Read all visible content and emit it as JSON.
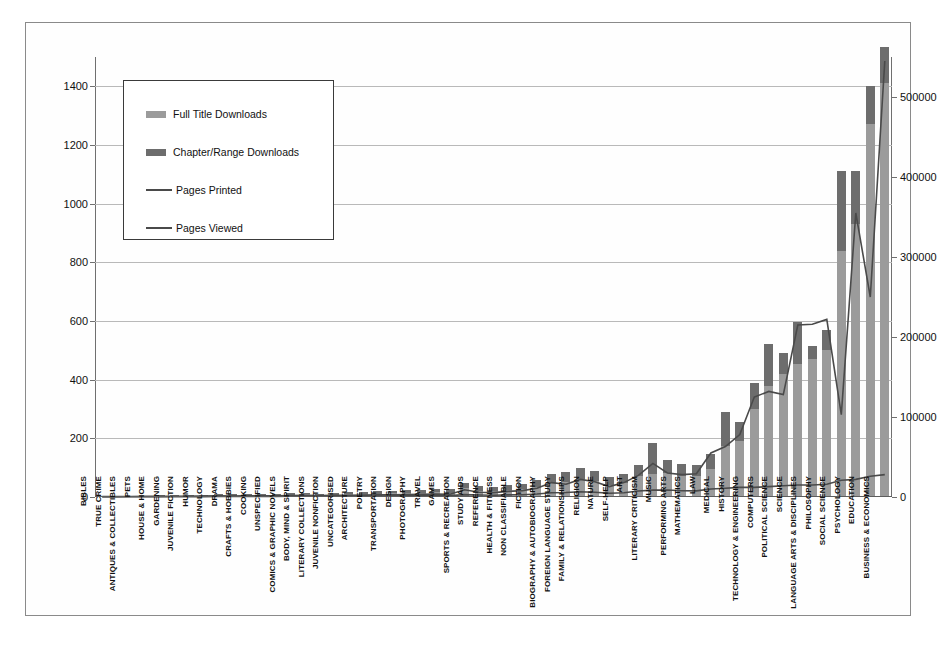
{
  "chart_data": {
    "type": "bar",
    "title": "",
    "subtitle": "",
    "xlabel": "",
    "ylabel": "",
    "y2label": "",
    "grid": true,
    "legend_position": "upper-left-inside",
    "ylim": [
      0,
      1500
    ],
    "y2lim": [
      0,
      550000
    ],
    "yticks": [
      "0",
      "200",
      "400",
      "600",
      "800",
      "1000",
      "1200",
      "1400"
    ],
    "ytick_values": [
      0,
      200,
      400,
      600,
      800,
      1000,
      1200,
      1400
    ],
    "y2ticks": [
      "0",
      "100000",
      "200000",
      "300000",
      "400000",
      "500000"
    ],
    "y2tick_values": [
      0,
      100000,
      200000,
      300000,
      400000,
      500000
    ],
    "categories": [
      "BIBLES",
      "TRUE CRIME",
      "ANTIQUES & COLLECTIBLES",
      "PETS",
      "HOUSE & HOME",
      "GARDENING",
      "JUVENILE FICTION",
      "HUMOR",
      "TECHNOLOGY",
      "DRAMA",
      "CRAFTS & HOBBIES",
      "COOKING",
      "UNSPECIFIED",
      "COMICS & GRAPHIC NOVELS",
      "BODY, MIND & SPIRIT",
      "LITERARY COLLECTIONS",
      "JUVENILE NONFICTION",
      "UNCATEGORISED",
      "ARCHITECTURE",
      "POETRY",
      "TRANSPORTATION",
      "DESIGN",
      "PHOTOGRAPHY",
      "TRAVEL",
      "GAMES",
      "SPORTS & RECREATION",
      "STUDY AIDS",
      "REFERENCE",
      "HEALTH & FITNESS",
      "NON CLASSIFIABLE",
      "FICTION",
      "BIOGRAPHY & AUTOBIOGRAPHY",
      "FOREIGN LANGUAGE STUDY",
      "FAMILY & RELATIONSHIPS",
      "RELIGION",
      "NATURE",
      "SELF-HELP",
      "ART",
      "LITERARY CRITICISM",
      "MUSIC",
      "PERFORMING ARTS",
      "MATHEMATICS",
      "LAW",
      "MEDICAL",
      "HISTORY",
      "TECHNOLOGY & ENGINEERING",
      "COMPUTERS",
      "POLITICAL SCIENCE",
      "SCIENCE",
      "LANGUAGE ARTS & DISCIPLINES",
      "PHILOSOPHY",
      "SOCIAL SCIENCE",
      "PSYCHOLOGY",
      "EDUCATION",
      "BUSINESS & ECONOMICS"
    ],
    "series": [
      {
        "name": "Full Title Downloads",
        "axis": "left",
        "kind": "bar-stacked",
        "color": "#9b9b9b",
        "values": [
          1,
          1,
          2,
          2,
          3,
          3,
          4,
          4,
          6,
          5,
          6,
          7,
          6,
          8,
          9,
          7,
          8,
          9,
          10,
          11,
          12,
          13,
          14,
          16,
          15,
          30,
          22,
          20,
          24,
          26,
          35,
          48,
          52,
          60,
          55,
          42,
          48,
          70,
          80,
          82,
          72,
          70,
          95,
          175,
          190,
          300,
          380,
          420,
          455,
          470,
          500,
          840,
          930,
          1270,
          1410
        ]
      },
      {
        "name": "Chapter/Range Downloads",
        "axis": "left",
        "kind": "bar-stacked",
        "color": "#6d6d6d",
        "values": [
          1,
          1,
          2,
          2,
          2,
          2,
          3,
          3,
          5,
          4,
          5,
          5,
          5,
          6,
          6,
          5,
          6,
          7,
          8,
          8,
          9,
          10,
          11,
          12,
          12,
          18,
          14,
          15,
          16,
          18,
          24,
          30,
          32,
          38,
          34,
          26,
          30,
          40,
          105,
          45,
          40,
          40,
          50,
          115,
          65,
          90,
          140,
          70,
          140,
          45,
          70,
          270,
          180,
          130,
          125
        ]
      },
      {
        "name": "Pages Printed",
        "axis": "right",
        "kind": "line",
        "color": "#4a4a4a",
        "values": [
          200,
          200,
          300,
          300,
          400,
          400,
          500,
          500,
          700,
          600,
          700,
          800,
          700,
          900,
          1000,
          900,
          1000,
          1100,
          1200,
          1300,
          1400,
          1500,
          1600,
          1800,
          1700,
          3000,
          2500,
          2300,
          2600,
          2900,
          3800,
          5200,
          5600,
          6500,
          6000,
          4600,
          5200,
          7500,
          8600,
          8800,
          7800,
          7600,
          10000,
          11000,
          12000,
          12000,
          13000,
          14000,
          15000,
          15000,
          16000,
          21000,
          22000,
          26000,
          28000
        ]
      },
      {
        "name": "Pages Viewed",
        "axis": "right",
        "kind": "line",
        "color": "#4a4a4a",
        "values": [
          500,
          500,
          600,
          700,
          800,
          900,
          1000,
          1100,
          1400,
          1200,
          1400,
          1600,
          1500,
          1800,
          2000,
          1900,
          2000,
          2200,
          2400,
          2600,
          2800,
          3000,
          3200,
          3600,
          3400,
          9000,
          6000,
          5500,
          7000,
          8000,
          11000,
          18000,
          16000,
          22000,
          19000,
          13000,
          18000,
          27000,
          42000,
          30000,
          28000,
          29000,
          55000,
          63000,
          78000,
          125000,
          132000,
          128000,
          215000,
          216000,
          222000,
          103000,
          355000,
          250000,
          545000
        ]
      }
    ]
  },
  "legend": {
    "items": [
      {
        "label": "Full Title Downloads",
        "type": "bar",
        "color": "#9b9b9b"
      },
      {
        "label": "Chapter/Range Downloads",
        "type": "bar",
        "color": "#6d6d6d"
      },
      {
        "label": "Pages Printed",
        "type": "line",
        "color": "#4a4a4a"
      },
      {
        "label": "Pages Viewed",
        "type": "line",
        "color": "#4a4a4a"
      }
    ]
  }
}
